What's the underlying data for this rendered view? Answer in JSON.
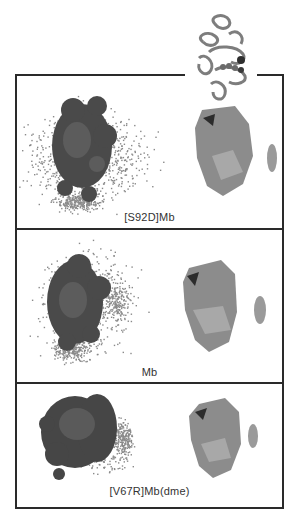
{
  "figure": {
    "top_structure": {
      "icon": "protein-ribbon-structure",
      "description": "Myoglobin ribbon cartoon"
    },
    "panels": [
      {
        "id": "s92d",
        "label": "[S92D]Mb",
        "left_icon": "surface-with-dot-cloud",
        "right_icon": "surface-with-side-cluster"
      },
      {
        "id": "mb",
        "label": "Mb",
        "left_icon": "surface-with-dot-cloud",
        "right_icon": "surface-with-side-cluster"
      },
      {
        "id": "v67r",
        "label": "[V67R]Mb(dme)",
        "left_icon": "surface-with-dot-cloud",
        "right_icon": "surface-with-side-cluster"
      }
    ]
  },
  "colors": {
    "frame": "#2a2a2a",
    "dots": "#8a8a8a",
    "dark_surface": "#4a4a4a",
    "light_surface": "#8c8c8c",
    "label": "#333333"
  }
}
